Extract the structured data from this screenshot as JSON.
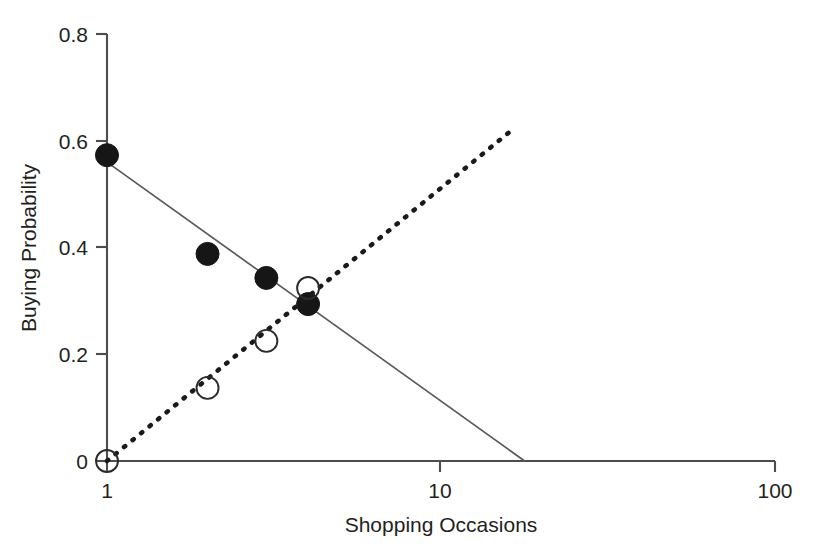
{
  "chart_data": {
    "type": "scatter",
    "title": "",
    "xlabel": "Shopping Occasions",
    "ylabel": "Buying Probability",
    "x_scale": "log",
    "xlim": [
      1,
      100
    ],
    "ylim": [
      0,
      0.8
    ],
    "grid": false,
    "legend": "none",
    "x_ticks": [
      "1",
      "10",
      "100"
    ],
    "x_tick_values": [
      1,
      10,
      100
    ],
    "y_ticks": [
      "0",
      "0.2",
      "0.4",
      "0.6",
      "0.8"
    ],
    "y_tick_values": [
      0,
      0.2,
      0.4,
      0.6,
      0.8
    ],
    "series": [
      {
        "name": "filled-circles-declining",
        "marker": "filled circle",
        "line_style": "solid",
        "x": [
          1,
          2,
          3,
          4
        ],
        "values": [
          0.573,
          0.388,
          0.343,
          0.294
        ],
        "fit_line": {
          "style": "solid",
          "x_start": 1,
          "y_start": 0.56,
          "x_end": 17.8,
          "y_end": 0.0
        }
      },
      {
        "name": "open-circles-rising",
        "marker": "open circle",
        "line_style": "dotted",
        "x": [
          1,
          2,
          3,
          4
        ],
        "values": [
          0.0,
          0.137,
          0.225,
          0.324
        ],
        "fit_line": {
          "style": "dotted",
          "x_start": 1,
          "y_start": 0.0,
          "x_end": 16.6,
          "y_end": 0.624
        }
      }
    ]
  },
  "axes": {
    "x_title": "Shopping Occasions",
    "y_title": "Buying Probability",
    "x_tick_labels": [
      "1",
      "10",
      "100"
    ],
    "y_tick_labels": [
      "0",
      "0.2",
      "0.4",
      "0.6",
      "0.8"
    ]
  },
  "colors": {
    "axis": "#4d4d4f",
    "text": "#231f20",
    "solid_line": "#58595b",
    "dashed_line": "#1a1a1a",
    "marker_filled": "#161616",
    "marker_open_stroke": "#2b2b2b",
    "background": "#ffffff"
  }
}
